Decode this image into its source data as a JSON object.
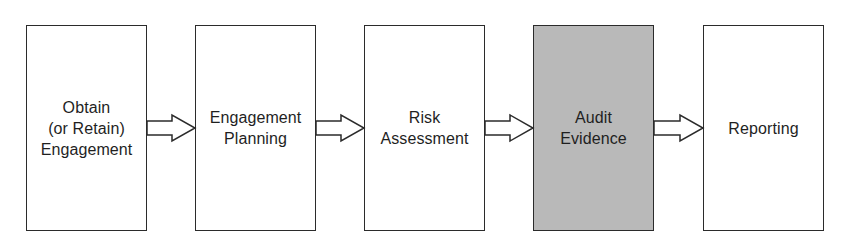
{
  "diagram": {
    "type": "process-flow",
    "direction": "left-to-right",
    "steps": [
      {
        "label": "Obtain\n(or Retain)\nEngagement",
        "highlighted": false
      },
      {
        "label": "Engagement\nPlanning",
        "highlighted": false
      },
      {
        "label": "Risk\nAssessment",
        "highlighted": false
      },
      {
        "label": "Audit\nEvidence",
        "highlighted": true
      },
      {
        "label": "Reporting",
        "highlighted": false
      }
    ],
    "connectors": [
      {
        "from": 0,
        "to": 1,
        "style": "hollow-block-arrow"
      },
      {
        "from": 1,
        "to": 2,
        "style": "hollow-block-arrow"
      },
      {
        "from": 2,
        "to": 3,
        "style": "hollow-block-arrow"
      },
      {
        "from": 3,
        "to": 4,
        "style": "hollow-block-arrow"
      }
    ],
    "colors": {
      "border": "#2b2b2b",
      "box_fill": "#ffffff",
      "highlight_fill": "#b9b9b9",
      "text": "#1f1f1f"
    }
  }
}
